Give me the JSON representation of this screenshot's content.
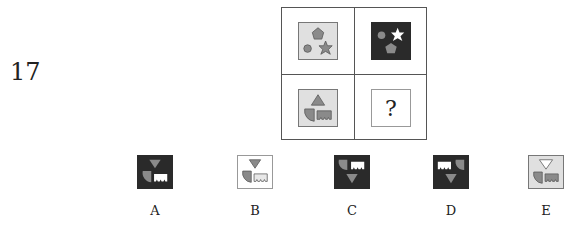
{
  "question": {
    "number": "17"
  },
  "grid": {
    "cells": [
      {
        "position": "top-left",
        "background": "light",
        "shapes": [
          "pentagon",
          "circle",
          "star"
        ]
      },
      {
        "position": "top-right",
        "background": "dark",
        "shapes": [
          "circle",
          "white-star",
          "pentagon"
        ]
      },
      {
        "position": "bottom-left",
        "background": "light",
        "shapes": [
          "triangle-up",
          "quarter-circle",
          "notched-rectangle"
        ]
      },
      {
        "position": "bottom-right",
        "background": "white",
        "content": "?"
      }
    ]
  },
  "options": [
    {
      "label": "A",
      "background": "dark",
      "shapes": [
        "triangle-down",
        "quarter-circle",
        "white-notched-rectangle"
      ]
    },
    {
      "label": "B",
      "background": "white",
      "shapes": [
        "triangle-down",
        "quarter-circle",
        "white-notched-rectangle"
      ]
    },
    {
      "label": "C",
      "background": "dark",
      "shapes": [
        "quarter-circle",
        "white-notched-rectangle",
        "triangle-down"
      ]
    },
    {
      "label": "D",
      "background": "dark",
      "shapes": [
        "white-notched-rectangle",
        "quarter-circle",
        "triangle-down"
      ]
    },
    {
      "label": "E",
      "background": "light",
      "shapes": [
        "white-triangle-down",
        "quarter-circle",
        "notched-rectangle"
      ]
    }
  ],
  "colors": {
    "shape_gray": "#8a8a8a",
    "dark_bg": "#2a2a2a",
    "light_bg": "#e0e0e0",
    "white": "#ffffff"
  }
}
